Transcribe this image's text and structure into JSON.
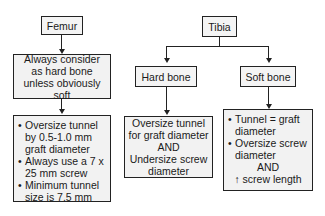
{
  "femur": {
    "title": "Femur",
    "rule": "Always consider as hard bone unless obviously soft",
    "recommendations": [
      "Oversize tunnel by 0.5-1.0 mm graft diameter",
      "Always use a 7 x 25 mm screw",
      "Minimum tunnel size is 7.5 mm"
    ]
  },
  "tibia": {
    "title": "Tibia",
    "hard_bone": {
      "label": "Hard bone",
      "recommendation_line1": "Oversize tunnel for graft diameter",
      "conjunction": "AND",
      "recommendation_line2": "Undersize screw diameter"
    },
    "soft_bone": {
      "label": "Soft bone",
      "recommendations": [
        "Tunnel = graft diameter",
        "Oversize screw diameter"
      ],
      "conjunction": "AND",
      "extra": "↑ screw length"
    }
  }
}
